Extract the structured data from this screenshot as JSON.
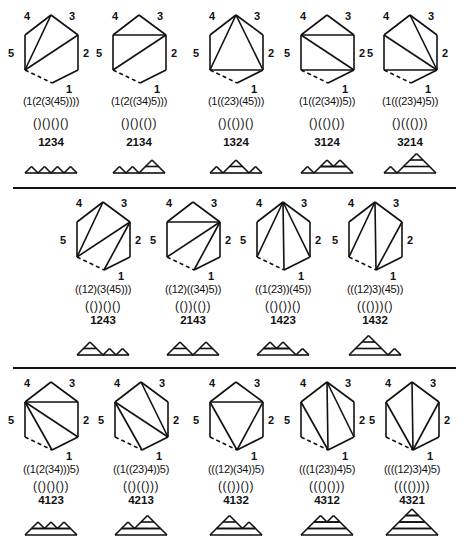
{
  "figure": {
    "edge_labels": [
      "1",
      "2",
      "3",
      "4",
      "5"
    ],
    "rows": [
      {
        "panels": [
          {
            "bracketing": "(1(2(3(45))))",
            "dyck": "()()()()",
            "permutation": "1234",
            "diagonals": [
              [
                "LL",
                "T"
              ],
              [
                "LL",
                "UR"
              ]
            ],
            "mountain": [
              1,
              1,
              1,
              1
            ],
            "cx": 51
          },
          {
            "bracketing": "(1(2((34)5)))",
            "dyck": "()()(())",
            "permutation": "2134",
            "diagonals": [
              [
                "UL",
                "UR"
              ],
              [
                "LL",
                "UR"
              ]
            ],
            "mountain": [
              1,
              1,
              2
            ],
            "cx": 139
          },
          {
            "bracketing": "(1((23)(45)))",
            "dyck": "()(())()",
            "permutation": "1324",
            "diagonals": [
              [
                "LL",
                "T"
              ],
              [
                "LL",
                "LR"
              ],
              [
                "T",
                "LR"
              ]
            ],
            "mountain": [
              1,
              2,
              1
            ],
            "cx": 236
          },
          {
            "bracketing": "(1((2(34))5))",
            "dyck": "()(()())",
            "permutation": "3124",
            "diagonals": [
              [
                "UL",
                "UR"
              ],
              [
                "UL",
                "LR"
              ],
              [
                "LL",
                "LR"
              ]
            ],
            "mountain": [
              1,
              [
                1,
                1
              ]
            ],
            "cx": 327
          },
          {
            "bracketing": "(1(((23)4)5))",
            "dyck": "()((()))",
            "permutation": "3214",
            "diagonals": [
              [
                "UL",
                "LR"
              ],
              [
                "T",
                "LR"
              ],
              [
                "LL",
                "LR"
              ]
            ],
            "mountain": [
              1,
              3
            ],
            "cx": 410
          }
        ]
      },
      {
        "panels": [
          {
            "bracketing": "((12)(3(45)))",
            "dyck": "(())()()",
            "permutation": "1243",
            "diagonals": [
              [
                "LL",
                "T"
              ],
              [
                "LL",
                "UR"
              ],
              [
                "B",
                "UR"
              ]
            ],
            "mountain": [
              2,
              1,
              1
            ],
            "cx": 103
          },
          {
            "bracketing": "((12)((34)5))",
            "dyck": "(())(())",
            "permutation": "2143",
            "diagonals": [
              [
                "UL",
                "UR"
              ],
              [
                "LL",
                "UR"
              ],
              [
                "B",
                "UR"
              ]
            ],
            "mountain": [
              2,
              2
            ],
            "cx": 193
          },
          {
            "bracketing": "((1(23))(45))",
            "dyck": "(()())()",
            "permutation": "1423",
            "diagonals": [
              [
                "LL",
                "T"
              ],
              [
                "T",
                "B"
              ],
              [
                "T",
                "LR"
              ]
            ],
            "mountain": [
              [
                1,
                1
              ],
              1
            ],
            "cx": 283
          },
          {
            "bracketing": "(((12)3)(45))",
            "dyck": "((()))()",
            "permutation": "1432",
            "diagonals": [
              [
                "LL",
                "T"
              ],
              [
                "T",
                "B"
              ],
              [
                "B",
                "UR"
              ]
            ],
            "mountain": [
              3,
              1
            ],
            "cx": 375
          }
        ]
      },
      {
        "panels": [
          {
            "bracketing": "((1(2(34)))5)",
            "dyck": "(()()())",
            "permutation": "4123",
            "diagonals": [
              [
                "UL",
                "UR"
              ],
              [
                "UL",
                "LR"
              ],
              [
                "UL",
                "B"
              ]
            ],
            "mountain": [
              [
                1,
                1,
                1
              ]
            ],
            "cx": 51
          },
          {
            "bracketing": "((1((23)4))5)",
            "dyck": "(()(()))",
            "permutation": "4213",
            "diagonals": [
              [
                "UL",
                "LR"
              ],
              [
                "UL",
                "B"
              ],
              [
                "T",
                "LR"
              ]
            ],
            "mountain": [
              [
                1,
                2
              ]
            ],
            "cx": 141
          },
          {
            "bracketing": "(((12)(34))5)",
            "dyck": "((())())",
            "permutation": "4132",
            "diagonals": [
              [
                "UL",
                "UR"
              ],
              [
                "UL",
                "B"
              ],
              [
                "UR",
                "B"
              ]
            ],
            "mountain": [
              [
                2,
                1
              ]
            ],
            "cx": 236
          },
          {
            "bracketing": "(((1(23))4)5)",
            "dyck": "((()()))",
            "permutation": "4312",
            "diagonals": [
              [
                "UL",
                "B"
              ],
              [
                "T",
                "B"
              ],
              [
                "T",
                "LR"
              ]
            ],
            "mountain": [
              [
                [
                  1,
                  1
                ]
              ]
            ],
            "cx": 327
          },
          {
            "bracketing": "((((12)3)4)5)",
            "dyck": "(((())))",
            "permutation": "4321",
            "diagonals": [
              [
                "UL",
                "B"
              ],
              [
                "T",
                "B"
              ],
              [
                "UR",
                "B"
              ]
            ],
            "mountain": [
              [
                [
                  [
                    1
                  ]
                ]
              ]
            ],
            "cx": 412
          }
        ]
      }
    ]
  }
}
